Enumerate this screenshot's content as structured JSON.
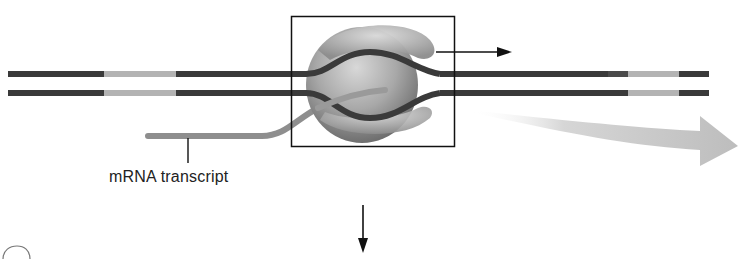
{
  "diagram": {
    "top_caption_cut": "",
    "labels": {
      "mrna": "mRNA transcript"
    },
    "elements": {
      "dna_strands": 2,
      "polymerase": "rna-polymerase",
      "direction_arrow": "right",
      "flow_arrow": "down"
    },
    "colors": {
      "dna_dark": "#3a3a3a",
      "dna_light": "#b0b0b0",
      "mrna": "#8a8a8a",
      "polymerase": "#9a9a9a",
      "box": "#111111",
      "big_arrow": "#c4c4c4"
    }
  }
}
